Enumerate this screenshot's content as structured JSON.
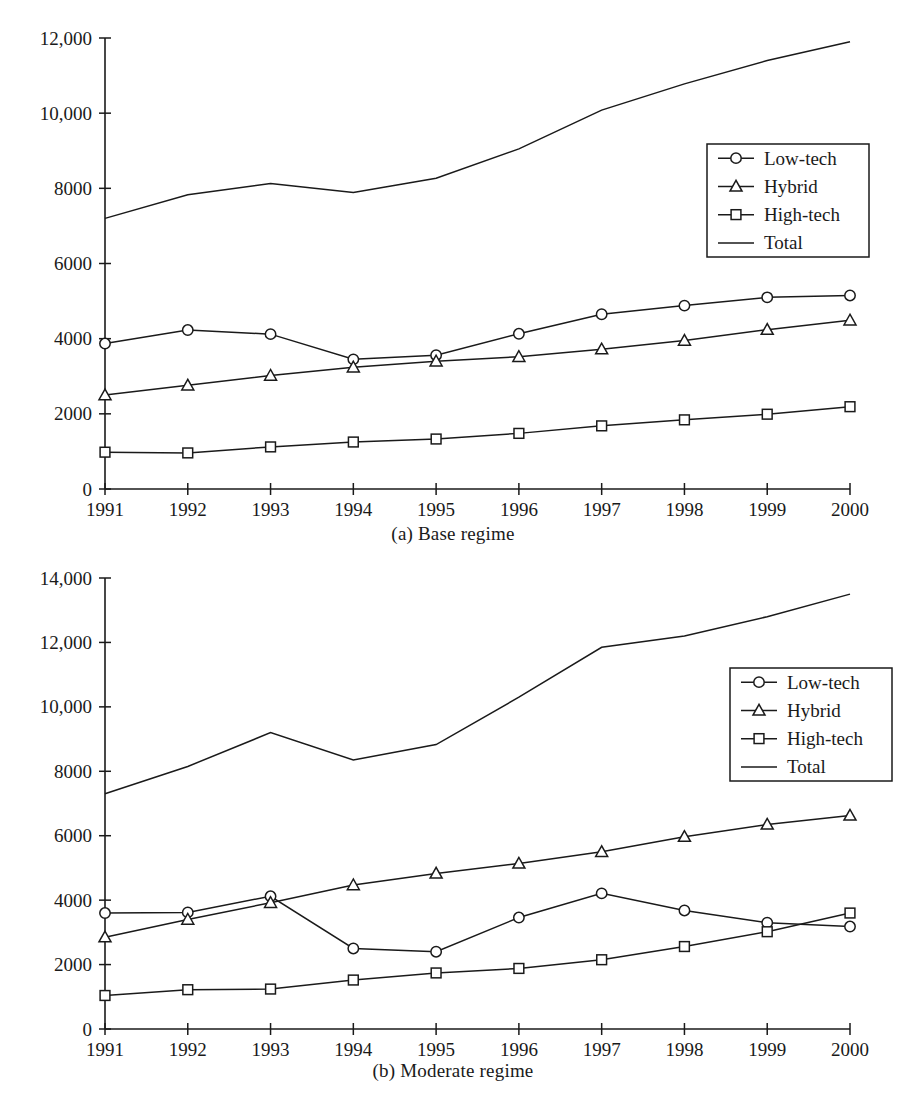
{
  "figure": {
    "panel_a_caption": "(a) Base regime",
    "panel_b_caption": "(b) Moderate regime",
    "line_color": "#1a1a1a",
    "background": "#ffffff"
  },
  "legend": {
    "entries": [
      {
        "label": "Low-tech",
        "marker": "circle-marker"
      },
      {
        "label": "Hybrid",
        "marker": "triangle-marker"
      },
      {
        "label": "High-tech",
        "marker": "square-marker"
      },
      {
        "label": "Total",
        "marker": "plain-line"
      }
    ],
    "position": "right-middle"
  },
  "chart_data": [
    {
      "type": "line",
      "title": "(a) Base regime",
      "xlabel": "",
      "ylabel": "",
      "x": [
        1991,
        1992,
        1993,
        1994,
        1995,
        1996,
        1997,
        1998,
        1999,
        2000
      ],
      "xticklabels": [
        "1991",
        "1992",
        "1993",
        "1994",
        "1995",
        "1996",
        "1997",
        "1998",
        "1999",
        "2000"
      ],
      "yticks": [
        0,
        2000,
        4000,
        6000,
        8000,
        10000,
        12000
      ],
      "yticklabels": [
        "0",
        "2000",
        "4000",
        "6000",
        "8000",
        "10,000",
        "12,000"
      ],
      "ylim": [
        0,
        12000
      ],
      "xlim": [
        1991,
        2000
      ],
      "grid": false,
      "legend_position": "right-middle",
      "series": [
        {
          "name": "Low-tech",
          "marker": "circle",
          "values": [
            3870,
            4230,
            4120,
            3450,
            3560,
            4130,
            4650,
            4880,
            5100,
            5150
          ]
        },
        {
          "name": "Hybrid",
          "marker": "triangle",
          "values": [
            2500,
            2760,
            3020,
            3240,
            3400,
            3520,
            3720,
            3950,
            4240,
            4490
          ]
        },
        {
          "name": "High-tech",
          "marker": "square",
          "values": [
            980,
            960,
            1120,
            1250,
            1330,
            1480,
            1680,
            1840,
            1990,
            2190
          ]
        },
        {
          "name": "Total",
          "marker": "none",
          "values": [
            7200,
            7830,
            8130,
            7890,
            8270,
            9050,
            10080,
            10780,
            11400,
            11900
          ]
        }
      ]
    },
    {
      "type": "line",
      "title": "(b) Moderate regime",
      "xlabel": "",
      "ylabel": "",
      "x": [
        1991,
        1992,
        1993,
        1994,
        1995,
        1996,
        1997,
        1998,
        1999,
        2000
      ],
      "xticklabels": [
        "1991",
        "1992",
        "1993",
        "1994",
        "1995",
        "1996",
        "1997",
        "1998",
        "1999",
        "2000"
      ],
      "yticks": [
        0,
        2000,
        4000,
        6000,
        8000,
        10000,
        12000,
        14000
      ],
      "yticklabels": [
        "0",
        "2000",
        "4000",
        "6000",
        "8000",
        "10,000",
        "12,000",
        "14,000"
      ],
      "ylim": [
        0,
        14000
      ],
      "xlim": [
        1991,
        2000
      ],
      "grid": false,
      "legend_position": "right-middle",
      "series": [
        {
          "name": "Low-tech",
          "marker": "circle",
          "values": [
            3600,
            3620,
            4120,
            2500,
            2400,
            3460,
            4210,
            3680,
            3300,
            3180
          ]
        },
        {
          "name": "Hybrid",
          "marker": "triangle",
          "values": [
            2850,
            3400,
            3920,
            4470,
            4830,
            5140,
            5500,
            5970,
            6350,
            6630
          ]
        },
        {
          "name": "High-tech",
          "marker": "square",
          "values": [
            1040,
            1220,
            1240,
            1520,
            1740,
            1880,
            2150,
            2560,
            3020,
            3600
          ]
        },
        {
          "name": "Total",
          "marker": "none",
          "values": [
            7300,
            8150,
            9200,
            8350,
            8830,
            10300,
            11850,
            12200,
            12800,
            13500
          ]
        }
      ]
    }
  ]
}
